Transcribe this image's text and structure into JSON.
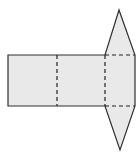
{
  "figure": {
    "name": "triangular-prism-net",
    "canvas": {
      "width": 140,
      "height": 161,
      "background": "#ffffff"
    },
    "style": {
      "face_fill": "#e9e9e9",
      "solid_stroke": "#2e2e2e",
      "dashed_stroke": "#222222",
      "stroke_width": 1.2,
      "dash_pattern": "4 3"
    },
    "silhouette_points": "8,55 105,55 119,10 135,55 135,106 120,150 105,106 8,106",
    "fold_lines": [
      {
        "name": "fold-line-left-panel",
        "x1": 57,
        "y1": 55,
        "x2": 57,
        "y2": 106
      },
      {
        "name": "fold-line-middle-panel",
        "x1": 105,
        "y1": 55,
        "x2": 105,
        "y2": 106
      },
      {
        "name": "fold-line-top-triangle-base",
        "x1": 105,
        "y1": 55,
        "x2": 135,
        "y2": 55
      },
      {
        "name": "fold-line-bottom-triangle-base",
        "x1": 105,
        "y1": 106,
        "x2": 135,
        "y2": 106
      }
    ]
  }
}
